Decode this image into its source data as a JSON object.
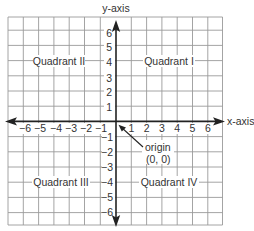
{
  "diagram": {
    "type": "coordinate-plane",
    "x_axis_label": "x-axis",
    "y_axis_label": "y-axis",
    "x_ticks": [
      "−6",
      "−5",
      "−4",
      "−3",
      "−2",
      "−1",
      "1",
      "2",
      "3",
      "4",
      "5",
      "6"
    ],
    "y_ticks_positive": [
      "6",
      "5",
      "4",
      "3",
      "2",
      "1"
    ],
    "y_ticks_negative": [
      "−1",
      "−2",
      "−3",
      "−4",
      "−5",
      "−6"
    ],
    "quadrants": {
      "q1": "Quadrant I",
      "q2": "Quadrant II",
      "q3": "Quadrant III",
      "q4": "Quadrant IV"
    },
    "origin": {
      "label": "origin",
      "coords": "(0, 0)"
    },
    "colors": {
      "grid": "#9a9a9a",
      "axis": "#222222",
      "text": "#333333",
      "background": "#ffffff"
    }
  }
}
